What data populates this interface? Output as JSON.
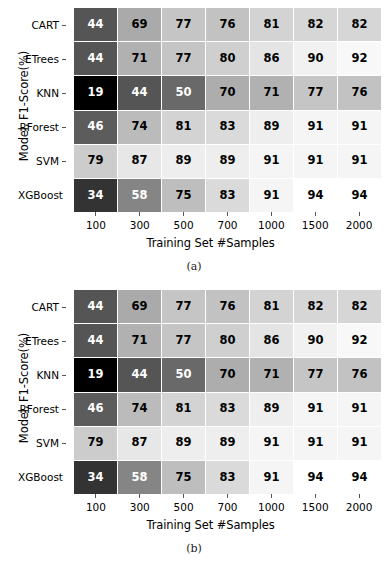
{
  "figure": {
    "background": "#ffffff",
    "text_color": "#000000"
  },
  "chart_data": [
    {
      "type": "heatmap",
      "panel": "a",
      "caption": "(a)",
      "title": "",
      "xlabel": "Training Set #Samples",
      "ylabel": "Model, F1-Score(%)",
      "categories": [
        "100",
        "300",
        "500",
        "700",
        "1000",
        "1500",
        "2000"
      ],
      "rows": [
        "CART",
        "ETrees",
        "KNN",
        "RForest",
        "SVM",
        "XGBoost"
      ],
      "colormap": "gray",
      "vmin": 19,
      "vmax": 94,
      "annotated": true,
      "grid": false,
      "legend": "none",
      "values": [
        [
          44,
          69,
          77,
          76,
          81,
          82,
          82
        ],
        [
          44,
          71,
          77,
          80,
          86,
          90,
          92
        ],
        [
          19,
          44,
          50,
          70,
          71,
          77,
          76
        ],
        [
          46,
          74,
          81,
          83,
          89,
          91,
          91
        ],
        [
          79,
          87,
          89,
          89,
          91,
          91,
          91
        ],
        [
          34,
          58,
          75,
          83,
          91,
          94,
          94
        ]
      ],
      "series": [
        {
          "name": "CART",
          "values": [
            44,
            69,
            77,
            76,
            81,
            82,
            82
          ]
        },
        {
          "name": "ETrees",
          "values": [
            44,
            71,
            77,
            80,
            86,
            90,
            92
          ]
        },
        {
          "name": "KNN",
          "values": [
            19,
            44,
            50,
            70,
            71,
            77,
            76
          ]
        },
        {
          "name": "RForest",
          "values": [
            46,
            74,
            81,
            83,
            89,
            91,
            91
          ]
        },
        {
          "name": "SVM",
          "values": [
            79,
            87,
            89,
            89,
            91,
            91,
            91
          ]
        },
        {
          "name": "XGBoost",
          "values": [
            34,
            58,
            75,
            83,
            91,
            94,
            94
          ]
        }
      ]
    },
    {
      "type": "heatmap",
      "panel": "b",
      "caption": "(b)",
      "title": "",
      "xlabel": "Training Set #Samples",
      "ylabel": "Model, F1-Score(%)",
      "categories": [
        "100",
        "300",
        "500",
        "700",
        "1000",
        "1500",
        "2000"
      ],
      "rows": [
        "CART",
        "ETrees",
        "KNN",
        "RForest",
        "SVM",
        "XGBoost"
      ],
      "colormap": "gray",
      "vmin": 19,
      "vmax": 94,
      "annotated": true,
      "grid": false,
      "legend": "none",
      "values": [
        [
          44,
          69,
          77,
          76,
          81,
          82,
          82
        ],
        [
          44,
          71,
          77,
          80,
          86,
          90,
          92
        ],
        [
          19,
          44,
          50,
          70,
          71,
          77,
          76
        ],
        [
          46,
          74,
          81,
          83,
          89,
          91,
          91
        ],
        [
          79,
          87,
          89,
          89,
          91,
          91,
          91
        ],
        [
          34,
          58,
          75,
          83,
          91,
          94,
          94
        ]
      ],
      "series": [
        {
          "name": "CART",
          "values": [
            44,
            69,
            77,
            76,
            81,
            82,
            82
          ]
        },
        {
          "name": "ETrees",
          "values": [
            44,
            71,
            77,
            80,
            86,
            90,
            92
          ]
        },
        {
          "name": "KNN",
          "values": [
            19,
            44,
            50,
            70,
            71,
            77,
            76
          ]
        },
        {
          "name": "RForest",
          "values": [
            46,
            74,
            81,
            83,
            89,
            91,
            91
          ]
        },
        {
          "name": "SVM",
          "values": [
            79,
            87,
            89,
            89,
            91,
            91,
            91
          ]
        },
        {
          "name": "XGBoost",
          "values": [
            34,
            58,
            75,
            83,
            91,
            94,
            94
          ]
        }
      ]
    }
  ]
}
